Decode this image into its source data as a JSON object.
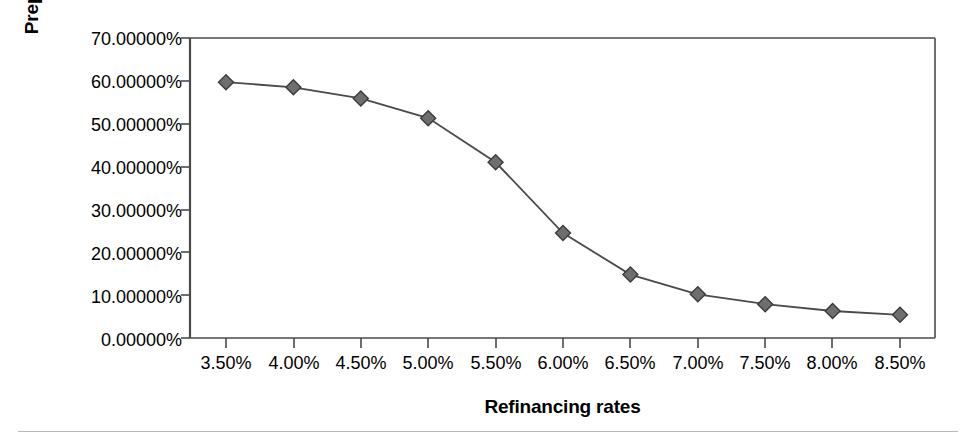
{
  "chart_data": {
    "type": "line",
    "title": "",
    "xlabel": "Refinancing rates",
    "ylabel": "Prepayment rates",
    "categories": [
      "3.50%",
      "4.00%",
      "4.50%",
      "5.00%",
      "5.50%",
      "6.00%",
      "6.50%",
      "7.00%",
      "7.50%",
      "8.00%",
      "8.50%"
    ],
    "values": [
      59.7,
      58.5,
      55.9,
      51.3,
      41.0,
      24.5,
      14.8,
      10.2,
      7.9,
      6.3,
      5.4
    ],
    "ytick_labels": [
      "70.00000%",
      "60.00000%",
      "50.00000%",
      "40.00000%",
      "30.00000%",
      "20.00000%",
      "10.00000%",
      "0.00000%"
    ],
    "ytick_values": [
      70,
      60,
      50,
      40,
      30,
      20,
      10,
      0
    ],
    "ylim": [
      0,
      70
    ],
    "grid": false,
    "legend": "none",
    "series": [
      {
        "name": "Prepayment rates",
        "marker": "diamond",
        "marker_color": "#6e6e6e",
        "marker_edge_color": "#3c3c3c",
        "line_color": "#4a4a4a",
        "values": [
          59.7,
          58.5,
          55.9,
          51.3,
          41.0,
          24.5,
          14.8,
          10.2,
          7.9,
          6.3,
          5.4
        ]
      }
    ]
  },
  "figure": {
    "axis_color": "#4a4a4a",
    "background": "#ffffff",
    "separator_color": "#b8b8b8"
  }
}
